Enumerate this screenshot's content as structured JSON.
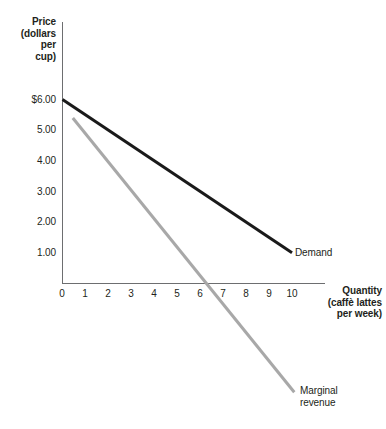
{
  "chart_data": {
    "type": "line",
    "title": "",
    "ylabel": "Price (dollars per cup)",
    "ylabel_lines": [
      "Price",
      "(dollars",
      "per",
      "cup)"
    ],
    "xlabel": "Quantity (caffè lattes per week)",
    "xlabel_lines": [
      "Quantity",
      "(caffè lattes",
      "per week)"
    ],
    "xlim": [
      0,
      11.4
    ],
    "ylim": [
      -4.3,
      8.5
    ],
    "grid": false,
    "legend": "inline-labels",
    "x_ticks": [
      {
        "value": 0,
        "label": "0"
      },
      {
        "value": 1,
        "label": "1"
      },
      {
        "value": 2,
        "label": "2"
      },
      {
        "value": 3,
        "label": "3"
      },
      {
        "value": 4,
        "label": "4"
      },
      {
        "value": 5,
        "label": "5"
      },
      {
        "value": 6,
        "label": "6"
      },
      {
        "value": 7,
        "label": "7"
      },
      {
        "value": 8,
        "label": "8"
      },
      {
        "value": 9,
        "label": "9"
      },
      {
        "value": 10,
        "label": "10"
      }
    ],
    "y_ticks": [
      {
        "value": 6,
        "label": "$6.00"
      },
      {
        "value": 5,
        "label": "5.00"
      },
      {
        "value": 4,
        "label": "4.00"
      },
      {
        "value": 3,
        "label": "3.00"
      },
      {
        "value": 2,
        "label": "2.00"
      },
      {
        "value": 1,
        "label": "1.00"
      }
    ],
    "series": [
      {
        "name": "Demand",
        "label": "Demand",
        "color": "#1a1a1a",
        "width": 3,
        "points": [
          [
            0,
            6.0
          ],
          [
            10,
            1.0
          ]
        ]
      },
      {
        "name": "Marginal revenue",
        "label": "Marginal\nrevenue",
        "color": "#a8a8a8",
        "width": 3,
        "points": [
          [
            0.45,
            5.4
          ],
          [
            10.1,
            -3.55
          ]
        ]
      }
    ],
    "axis_color": "#6d6e70",
    "axis_width": 1
  }
}
